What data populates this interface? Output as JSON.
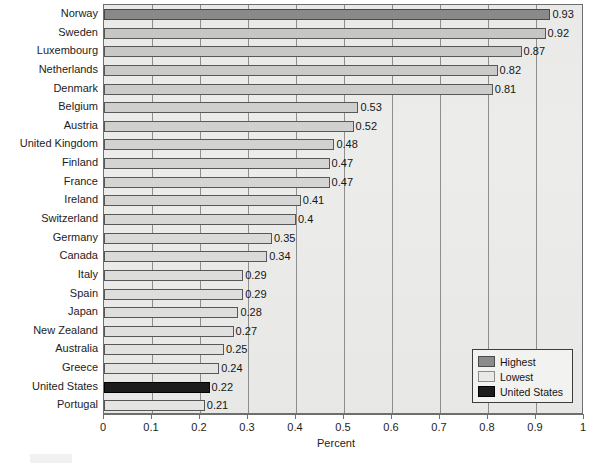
{
  "chart_data": {
    "type": "bar",
    "orientation": "horizontal",
    "title": "",
    "xlabel": "Percent",
    "ylabel": "",
    "xlim": [
      0,
      1
    ],
    "xticks": [
      "0",
      "0.1",
      "0.2",
      "0.3",
      "0.4",
      "0.5",
      "0.6",
      "0.7",
      "0.8",
      "0.9",
      "1"
    ],
    "grid": true,
    "legend_position": "bottom-right",
    "categories": [
      "Norway",
      "Sweden",
      "Luxembourg",
      "Netherlands",
      "Denmark",
      "Belgium",
      "Austria",
      "United Kingdom",
      "Finland",
      "France",
      "Ireland",
      "Switzerland",
      "Germany",
      "Canada",
      "Italy",
      "Spain",
      "Japan",
      "New Zealand",
      "Australia",
      "Greece",
      "United States",
      "Portugal"
    ],
    "values": [
      0.93,
      0.92,
      0.87,
      0.82,
      0.81,
      0.53,
      0.52,
      0.48,
      0.47,
      0.47,
      0.41,
      0.4,
      0.35,
      0.34,
      0.29,
      0.29,
      0.28,
      0.27,
      0.25,
      0.24,
      0.22,
      0.21
    ],
    "value_labels": [
      "0.93",
      "0.92",
      "0.87",
      "0.82",
      "0.81",
      "0.53",
      "0.52",
      "0.48",
      "0.47",
      "0.47",
      "0.41",
      "0.4",
      "0.35",
      "0.34",
      "0.29",
      "0.29",
      "0.28",
      "0.27",
      "0.25",
      "0.24",
      "0.22",
      "0.21"
    ],
    "bar_kinds": [
      "highest",
      "normal",
      "normal",
      "normal",
      "normal",
      "normal",
      "normal",
      "normal",
      "normal",
      "normal",
      "normal",
      "normal",
      "normal",
      "normal",
      "normal",
      "normal",
      "normal",
      "normal",
      "normal",
      "normal",
      "us",
      "lowest"
    ],
    "colors": {
      "highest": "#8b8b8b",
      "lowest": "#e9e9e8",
      "united_states": "#1c1c1c",
      "plot_background": "#ececeb",
      "gridline": "#8f8f8f",
      "axis": "#6e6e6e"
    }
  },
  "legend": {
    "items": [
      {
        "label": "Highest",
        "kind": "highest"
      },
      {
        "label": "Lowest",
        "kind": "lowest"
      },
      {
        "label": "United States",
        "kind": "us"
      }
    ]
  },
  "axis": {
    "x_title": "Percent"
  }
}
